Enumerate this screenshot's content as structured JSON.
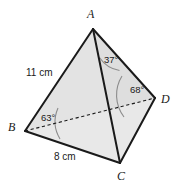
{
  "figure": {
    "type": "tetrahedron-diagram",
    "background_color": "#ffffff",
    "face_fill_color": "#e3e3e3",
    "edge_color": "#1a1a1a",
    "arc_color": "#8c8c8c",
    "vertices": [
      {
        "key": "A",
        "label": "A",
        "x": 93,
        "y": 29,
        "label_x": 87,
        "label_y": 8
      },
      {
        "key": "B",
        "label": "B",
        "x": 25,
        "y": 131,
        "label_x": 8,
        "label_y": 121
      },
      {
        "key": "C",
        "label": "C",
        "x": 120,
        "y": 163,
        "label_x": 117,
        "label_y": 170
      },
      {
        "key": "D",
        "label": "D",
        "x": 155,
        "y": 98,
        "label_x": 161,
        "label_y": 93
      }
    ],
    "edges": [
      {
        "from": "A",
        "to": "B",
        "style": "solid"
      },
      {
        "from": "A",
        "to": "C",
        "style": "solid"
      },
      {
        "from": "A",
        "to": "D",
        "style": "solid"
      },
      {
        "from": "B",
        "to": "C",
        "style": "solid"
      },
      {
        "from": "C",
        "to": "D",
        "style": "solid"
      },
      {
        "from": "B",
        "to": "D",
        "style": "dashed"
      }
    ],
    "measurements": [
      {
        "id": "edge-ab-length",
        "text": "11 cm",
        "edge": "AB",
        "x": 26,
        "y": 68
      },
      {
        "id": "edge-bc-length",
        "text": "8 cm",
        "edge": "BC",
        "x": 54,
        "y": 152
      }
    ],
    "angles": [
      {
        "id": "angle-at-a",
        "text": "37°",
        "vertex": "A",
        "x": 104,
        "y": 55
      },
      {
        "id": "angle-at-b",
        "text": "63°",
        "vertex": "B",
        "x": 41,
        "y": 113
      },
      {
        "id": "angle-at-d",
        "text": "68°",
        "vertex": "D",
        "x": 130,
        "y": 85
      }
    ]
  }
}
